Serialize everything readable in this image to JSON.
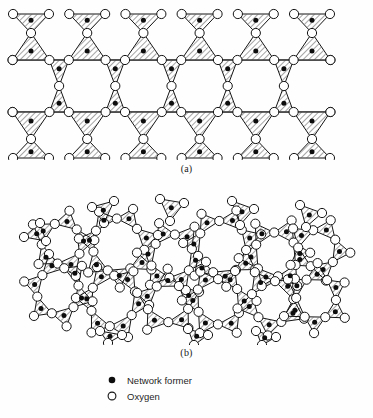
{
  "figure": {
    "panels": [
      {
        "id": "a",
        "label": "(a)",
        "description": "crystalline network",
        "structure_type": "crystalline"
      },
      {
        "id": "b",
        "label": "(b)",
        "description": "amorphous network",
        "structure_type": "amorphous"
      }
    ]
  },
  "legend": {
    "items": [
      {
        "marker": "filled-circle",
        "icon_name": "filled-circle-icon",
        "label": "Network former"
      },
      {
        "marker": "open-circle",
        "icon_name": "open-circle-icon",
        "label": "Oxygen"
      }
    ]
  },
  "style": {
    "stroke": "#141414",
    "node_fill": "#ffffff",
    "former_fill": "#0d0d0d",
    "hatch_color": "#2a2a2a",
    "background": "#fefefe"
  },
  "diagram_data": {
    "type": "network-diagram",
    "node_roles": [
      "network former",
      "oxygen"
    ],
    "unit": "triangle",
    "unit_note": "each hatched triangle contains one network former at its centre and three oxygen atoms at its vertices",
    "panel_a": {
      "lattice": "regular repeating",
      "columns": 6,
      "rings": "hexagonal, all equal size",
      "triangles_per_column": 4,
      "ring_sizes": [
        6
      ],
      "triangle_centers": [
        {
          "cx": 47,
          "cy": 25,
          "dir": "down"
        },
        {
          "cx": 47,
          "cy": 57,
          "dir": "up"
        },
        {
          "cx": 72,
          "cy": 73,
          "dir": "down"
        },
        {
          "cx": 47,
          "cy": 121,
          "dir": "down"
        },
        {
          "cx": 47,
          "cy": 146,
          "dir": "up"
        },
        {
          "cx": 100,
          "cy": 25,
          "dir": "down"
        },
        {
          "cx": 100,
          "cy": 57,
          "dir": "up"
        },
        {
          "cx": 125,
          "cy": 73,
          "dir": "down"
        },
        {
          "cx": 100,
          "cy": 121,
          "dir": "down"
        },
        {
          "cx": 100,
          "cy": 146,
          "dir": "up"
        },
        {
          "cx": 153,
          "cy": 25,
          "dir": "down"
        },
        {
          "cx": 153,
          "cy": 57,
          "dir": "up"
        },
        {
          "cx": 178,
          "cy": 73,
          "dir": "down"
        },
        {
          "cx": 153,
          "cy": 121,
          "dir": "down"
        },
        {
          "cx": 153,
          "cy": 146,
          "dir": "up"
        },
        {
          "cx": 206,
          "cy": 25,
          "dir": "down"
        },
        {
          "cx": 206,
          "cy": 57,
          "dir": "up"
        },
        {
          "cx": 231,
          "cy": 73,
          "dir": "down"
        },
        {
          "cx": 206,
          "cy": 121,
          "dir": "down"
        },
        {
          "cx": 206,
          "cy": 146,
          "dir": "up"
        },
        {
          "cx": 259,
          "cy": 25,
          "dir": "down"
        },
        {
          "cx": 259,
          "cy": 57,
          "dir": "up"
        },
        {
          "cx": 284,
          "cy": 73,
          "dir": "down"
        },
        {
          "cx": 259,
          "cy": 121,
          "dir": "down"
        },
        {
          "cx": 259,
          "cy": 146,
          "dir": "up"
        },
        {
          "cx": 312,
          "cy": 25,
          "dir": "down"
        },
        {
          "cx": 312,
          "cy": 57,
          "dir": "up"
        },
        {
          "cx": 312,
          "cy": 121,
          "dir": "down"
        },
        {
          "cx": 312,
          "cy": 146,
          "dir": "up"
        }
      ]
    },
    "panel_b": {
      "lattice": "irregular / random network",
      "rings": "irregular, mixed sizes",
      "ring_sizes": [
        5,
        6,
        7
      ],
      "triangle_count": 34
    }
  }
}
